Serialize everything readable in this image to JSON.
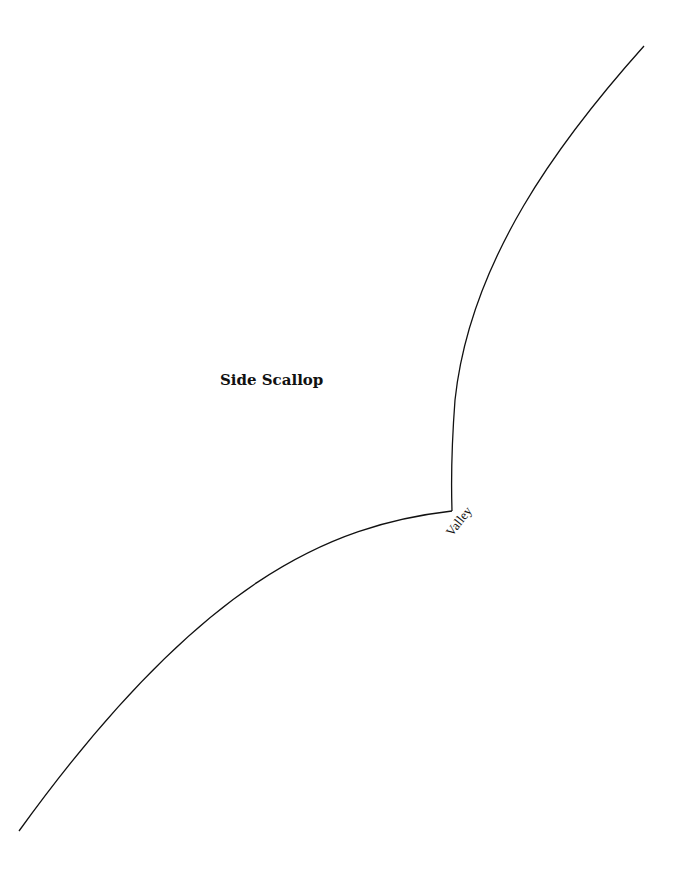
{
  "pattern": {
    "title": "Side Scallop",
    "cusp_label": "Valley",
    "stroke_color": "#111111",
    "background": "#ffffff"
  }
}
